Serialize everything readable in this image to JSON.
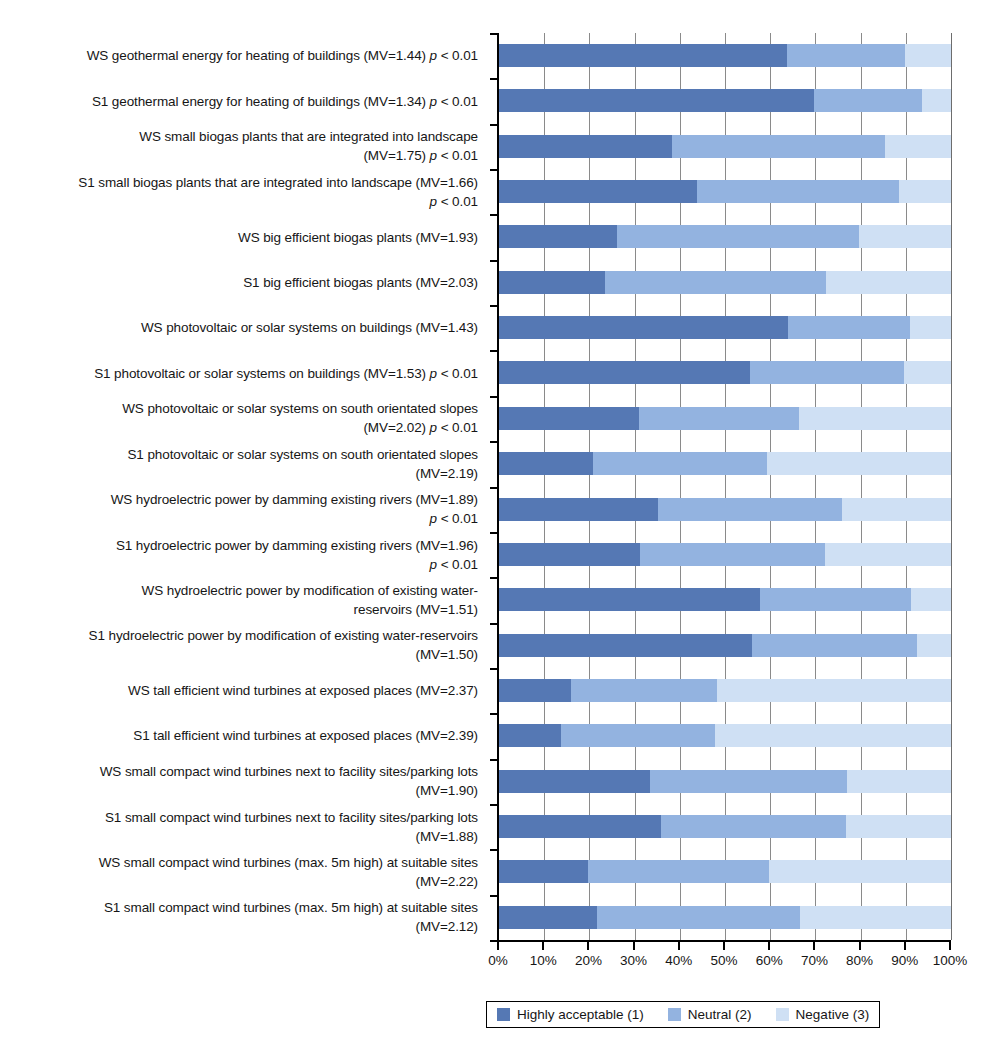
{
  "chart_data": {
    "type": "bar",
    "subtype": "horizontal-stacked-percent",
    "title": "",
    "xlabel": "",
    "ylabel": "",
    "xlim": [
      0,
      100
    ],
    "xticks": [
      "0%",
      "10%",
      "20%",
      "30%",
      "40%",
      "50%",
      "60%",
      "70%",
      "80%",
      "90%",
      "100%"
    ],
    "grid": true,
    "legend_position": "bottom",
    "legend": [
      {
        "label": "Highly acceptable (1)",
        "color": "#5578b4"
      },
      {
        "label": "Neutral (2)",
        "color": "#93b3e0"
      },
      {
        "label": "Negative (3)",
        "color": "#cfe0f4"
      }
    ],
    "series": [
      {
        "name": "Highly acceptable (1)",
        "color": "#5578b4",
        "values": [
          63.7,
          69.6,
          38.3,
          43.7,
          26.1,
          23.4,
          63.9,
          55.6,
          30.9,
          20.9,
          35.2,
          31.1,
          57.8,
          56.0,
          15.9,
          13.8,
          33.5,
          35.9,
          19.8,
          21.7
        ]
      },
      {
        "name": "Neutral (2)",
        "color": "#93b3e0",
        "values": [
          26.1,
          24.0,
          47.2,
          44.9,
          53.5,
          48.9,
          27.1,
          33.9,
          35.4,
          38.4,
          40.7,
          41.1,
          33.4,
          36.5,
          32.3,
          33.9,
          43.5,
          40.9,
          39.9,
          45.0
        ]
      },
      {
        "name": "Negative (3)",
        "color": "#cfe0f4",
        "values": [
          10.2,
          6.4,
          14.5,
          11.4,
          20.4,
          27.7,
          9.0,
          10.5,
          33.7,
          40.7,
          24.1,
          27.8,
          8.8,
          7.5,
          51.8,
          52.3,
          23.0,
          23.2,
          40.3,
          33.3
        ]
      }
    ],
    "categories": [
      {
        "lines": [
          "WS geothermal energy for heating of buildings (MV=1.44) p < 0.01"
        ],
        "italic_parts": [
          "p"
        ],
        "mv": "1.44",
        "p": "p < 0.01"
      },
      {
        "lines": [
          "S1 geothermal energy for heating of buildings (MV=1.34) p < 0.01"
        ],
        "italic_parts": [
          "p"
        ],
        "mv": "1.34",
        "p": "p < 0.01"
      },
      {
        "lines": [
          "WS small biogas plants that are integrated into landscape",
          "(MV=1.75) p < 0.01"
        ],
        "mv": "1.75",
        "p": "p < 0.01"
      },
      {
        "lines": [
          "S1 small biogas plants that are integrated into landscape (MV=1.66)",
          "p < 0.01"
        ],
        "mv": "1.66",
        "p": "p < 0.01"
      },
      {
        "lines": [
          "WS big efficient biogas plants (MV=1.93)"
        ],
        "mv": "1.93",
        "p": ""
      },
      {
        "lines": [
          "S1 big efficient biogas plants (MV=2.03)"
        ],
        "mv": "2.03",
        "p": ""
      },
      {
        "lines": [
          "WS photovoltaic or solar systems on buildings (MV=1.43)"
        ],
        "mv": "1.43",
        "p": ""
      },
      {
        "lines": [
          "S1 photovoltaic or solar systems on buildings (MV=1.53) p < 0.01"
        ],
        "mv": "1.53",
        "p": "p < 0.01"
      },
      {
        "lines": [
          "WS photovoltaic or solar systems on south orientated slopes",
          "(MV=2.02) p < 0.01"
        ],
        "mv": "2.02",
        "p": "p < 0.01"
      },
      {
        "lines": [
          "S1 photovoltaic or solar systems on south orientated slopes",
          "(MV=2.19)"
        ],
        "mv": "2.19",
        "p": ""
      },
      {
        "lines": [
          "WS hydroelectric power by damming existing rivers (MV=1.89)",
          "p < 0.01"
        ],
        "mv": "1.89",
        "p": "p < 0.01"
      },
      {
        "lines": [
          "S1 hydroelectric power by damming existing rivers (MV=1.96)",
          "p < 0.01"
        ],
        "mv": "1.96",
        "p": "p < 0.01"
      },
      {
        "lines": [
          "WS hydroelectric power by modification of existing water-",
          "reservoirs (MV=1.51)"
        ],
        "mv": "1.51",
        "p": ""
      },
      {
        "lines": [
          "S1 hydroelectric power by modification of existing water-reservoirs",
          "(MV=1.50)"
        ],
        "mv": "1.50",
        "p": ""
      },
      {
        "lines": [
          "WS tall efficient wind turbines at exposed places (MV=2.37)"
        ],
        "mv": "2.37",
        "p": ""
      },
      {
        "lines": [
          "S1 tall efficient wind turbines at exposed places (MV=2.39)"
        ],
        "mv": "2.39",
        "p": ""
      },
      {
        "lines": [
          "WS small compact wind turbines next to facility sites/parking lots",
          "(MV=1.90)"
        ],
        "mv": "1.90",
        "p": ""
      },
      {
        "lines": [
          "S1 small compact wind turbines next to facility sites/parking lots",
          "(MV=1.88)"
        ],
        "mv": "1.88",
        "p": ""
      },
      {
        "lines": [
          "WS small compact wind turbines (max. 5m high) at suitable sites",
          "(MV=2.22)"
        ],
        "mv": "2.22",
        "p": ""
      },
      {
        "lines": [
          "S1 small compact wind turbines (max. 5m high) at suitable sites",
          "(MV=2.12)"
        ],
        "mv": "2.12",
        "p": ""
      }
    ]
  }
}
